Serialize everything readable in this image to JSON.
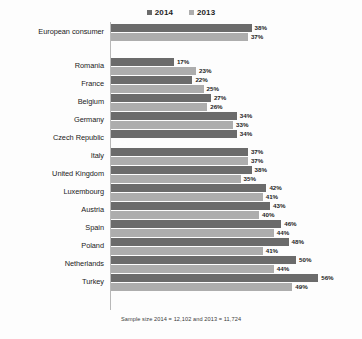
{
  "chart_data": {
    "type": "bar",
    "orientation": "horizontal",
    "title": "",
    "xlabel": "",
    "ylabel": "",
    "xlim": [
      0,
      60
    ],
    "grid": false,
    "legend_position": "top-center",
    "categories": [
      "European consumer",
      "Romania",
      "France",
      "Belgium",
      "Germany",
      "Czech Republic",
      "Italy",
      "United Kingdom",
      "Luxembourg",
      "Austria",
      "Spain",
      "Poland",
      "Netherlands",
      "Turkey"
    ],
    "series": [
      {
        "name": "2014",
        "color": "#6b6b6b",
        "values": [
          38,
          17,
          22,
          27,
          34,
          34,
          37,
          38,
          42,
          43,
          46,
          48,
          50,
          56
        ],
        "labels": [
          "38%",
          "17%",
          "22%",
          "27%",
          "34%",
          "34%",
          "37%",
          "38%",
          "42%",
          "43%",
          "46%",
          "48%",
          "50%",
          "56%"
        ]
      },
      {
        "name": "2013",
        "color": "#adadad",
        "values": [
          37,
          23,
          25,
          26,
          33,
          null,
          37,
          35,
          41,
          40,
          44,
          41,
          44,
          49
        ],
        "labels": [
          "37%",
          "23%",
          "25%",
          "26%",
          "33%",
          "#N/A",
          "37%",
          "35%",
          "41%",
          "40%",
          "44%",
          "41%",
          "44%",
          "49%"
        ]
      }
    ],
    "annotations": [
      "#N/A"
    ],
    "footnote": "Sample size 2014 = 12,102 and 2013 = 11,724"
  },
  "legend": {
    "entries": [
      {
        "label": "2014",
        "color": "#6b6b6b"
      },
      {
        "label": "2013",
        "color": "#adadad"
      }
    ]
  },
  "footnote": {
    "text": "Sample size 2014 = 12,102 and 2013 = 11,724"
  }
}
